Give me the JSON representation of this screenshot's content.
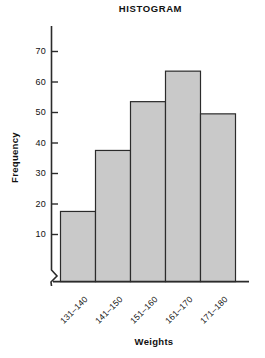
{
  "chart_data": {
    "type": "bar",
    "title": "HISTOGRAM",
    "xlabel": "Weights",
    "ylabel": "Frequency",
    "categories": [
      "131–140",
      "141–150",
      "151–160",
      "161–170",
      "171–180"
    ],
    "values": [
      23,
      43,
      59,
      69,
      55
    ],
    "ylim": [
      0,
      75
    ],
    "yticks": [
      10,
      20,
      30,
      40,
      50,
      60,
      70
    ],
    "ytick_labels": [
      "10",
      "20",
      "30",
      "40",
      "50",
      "60",
      "70"
    ],
    "grid": false,
    "legend": null,
    "axis_break": "y-axis-break-zigzag",
    "bar_fill": "#c9c9c9",
    "bar_stroke": "#2b2b2b",
    "axis_color": "#2b2b2b",
    "text_color": "#111111",
    "background": "#ffffff"
  },
  "axes": {
    "y_tick_labels": [
      "70",
      "60",
      "50",
      "40",
      "30",
      "20",
      "10"
    ],
    "x_tick_labels": [
      "131–140",
      "141–150",
      "151–160",
      "161–170",
      "171–180"
    ]
  }
}
